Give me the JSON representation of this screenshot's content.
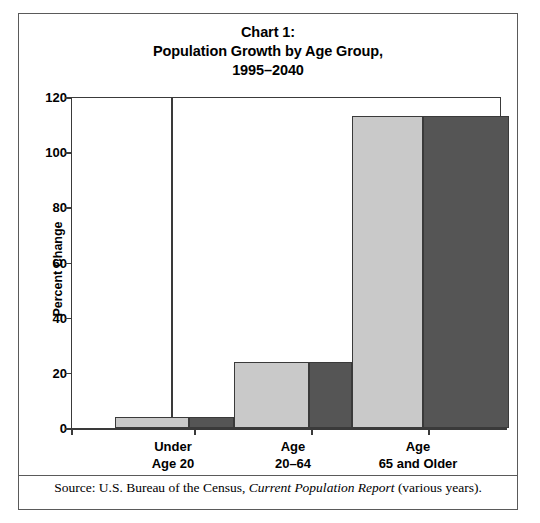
{
  "figure": {
    "title_lines": [
      "Chart 1:",
      "Population Growth by Age Group,",
      "1995–2040"
    ],
    "source_prefix": "Source: U.S. Bureau of the Census, ",
    "source_italic": "Current Population Report",
    "source_suffix": " (various years)."
  },
  "colors": {
    "series_light": "#c9c9c9",
    "series_dark": "#555555",
    "outline": "#3a3a3a",
    "frame": "#5a5a5a",
    "text": "#000000",
    "background": "#ffffff"
  },
  "chart_data": {
    "type": "bar",
    "title": "Chart 1: Population Growth by Age Group, 1995–2040",
    "xlabel": "",
    "ylabel": "Percent Change",
    "categories": [
      "Under Age 20",
      "Age 20–64",
      "Age 65 and Older"
    ],
    "category_lines": [
      [
        "Under",
        "Age 20"
      ],
      [
        "Age",
        "20–64"
      ],
      [
        "Age",
        "65 and Older"
      ]
    ],
    "series": [
      {
        "name": "series-light",
        "color": "#c9c9c9",
        "values": [
          4,
          24,
          113
        ]
      },
      {
        "name": "series-dark",
        "color": "#555555",
        "values": [
          4,
          24,
          113
        ]
      }
    ],
    "ylim": [
      0,
      120
    ],
    "yticks": [
      0,
      20,
      40,
      60,
      80,
      100,
      120
    ],
    "ytick_labels": [
      "0",
      "20",
      "40",
      "60",
      "80",
      "100",
      "120"
    ],
    "grid": false,
    "legend": "none"
  },
  "bar_layout": [
    {
      "name": "bar-under-age-20-light",
      "series": 0,
      "category": 0,
      "left": 44,
      "width": 74,
      "value": 4
    },
    {
      "name": "bar-under-age-20-dark",
      "series": 1,
      "category": 0,
      "left": 118,
      "width": 45,
      "value": 4
    },
    {
      "name": "bar-age-20-64-light",
      "series": 0,
      "category": 1,
      "left": 163,
      "width": 75,
      "value": 24
    },
    {
      "name": "bar-age-20-64-dark",
      "series": 1,
      "category": 1,
      "left": 238,
      "width": 43,
      "value": 24
    },
    {
      "name": "bar-age-65-older-light",
      "series": 0,
      "category": 2,
      "left": 281,
      "width": 71,
      "value": 113
    },
    {
      "name": "bar-age-65-older-dark",
      "series": 1,
      "category": 2,
      "left": 352,
      "width": 86,
      "value": 113
    }
  ],
  "xtick_positions": [
    0,
    123,
    240,
    357
  ],
  "category_label_positions": [
    {
      "left": 22,
      "width": 160
    },
    {
      "left": 142,
      "width": 160
    },
    {
      "left": 257,
      "width": 180
    }
  ]
}
